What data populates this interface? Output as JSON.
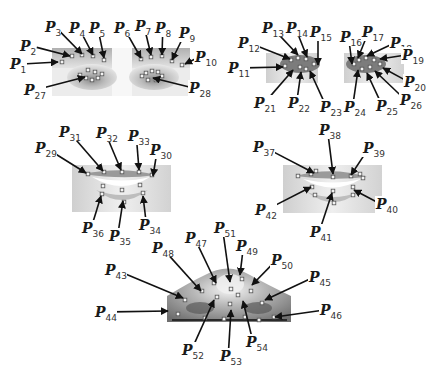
{
  "figure": {
    "point_color": "#f2f2f2",
    "arrow_color": "#111111"
  },
  "panels": [
    {
      "id": "eyes-left-image",
      "description": "Eyebrows and eyes",
      "image_box": [
        52,
        50,
        190,
        95
      ],
      "labels": [
        {
          "name": "P",
          "sub": "1",
          "lx": 18,
          "ly": 64,
          "tx": 58,
          "ty": 62
        },
        {
          "name": "P",
          "sub": "2",
          "lx": 28,
          "ly": 46,
          "tx": 70,
          "ty": 56
        },
        {
          "name": "P",
          "sub": "3",
          "lx": 53,
          "ly": 27,
          "tx": 82,
          "ty": 54
        },
        {
          "name": "P",
          "sub": "4",
          "lx": 77,
          "ly": 28,
          "tx": 93,
          "ty": 55
        },
        {
          "name": "P",
          "sub": "5",
          "lx": 97,
          "ly": 28,
          "tx": 104,
          "ty": 58
        },
        {
          "name": "P",
          "sub": "6",
          "lx": 122,
          "ly": 28,
          "tx": 141,
          "ty": 58
        },
        {
          "name": "P",
          "sub": "7",
          "lx": 143,
          "ly": 26,
          "tx": 151,
          "ty": 55
        },
        {
          "name": "P",
          "sub": "8",
          "lx": 163,
          "ly": 28,
          "tx": 162,
          "ty": 55
        },
        {
          "name": "P",
          "sub": "9",
          "lx": 187,
          "ly": 33,
          "tx": 172,
          "ty": 60
        },
        {
          "name": "P",
          "sub": "10",
          "lx": 203,
          "ly": 57,
          "tx": 185,
          "ty": 64
        },
        {
          "name": "P",
          "sub": "27",
          "lx": 32,
          "ly": 90,
          "tx": 85,
          "ty": 77
        },
        {
          "name": "P",
          "sub": "28",
          "lx": 197,
          "ly": 88,
          "tx": 153,
          "ty": 78
        }
      ],
      "points": [
        [
          62,
          62
        ],
        [
          72,
          56
        ],
        [
          82,
          55
        ],
        [
          93,
          56
        ],
        [
          104,
          60
        ],
        [
          141,
          59
        ],
        [
          151,
          57
        ],
        [
          162,
          56
        ],
        [
          172,
          61
        ],
        [
          182,
          65
        ],
        [
          88,
          70
        ],
        [
          80,
          75
        ],
        [
          86,
          78
        ],
        [
          92,
          80
        ],
        [
          98,
          78
        ],
        [
          102,
          74
        ],
        [
          95,
          72
        ],
        [
          146,
          73
        ],
        [
          152,
          71
        ],
        [
          158,
          72
        ],
        [
          162,
          76
        ],
        [
          156,
          80
        ],
        [
          148,
          80
        ],
        [
          142,
          76
        ]
      ]
    },
    {
      "id": "eyes-right-image",
      "description": "Eye contour close-up",
      "image_box": [
        266,
        53,
        404,
        83
      ],
      "labels": [
        {
          "name": "P",
          "sub": "11",
          "lx": 236,
          "ly": 68,
          "tx": 283,
          "ty": 67
        },
        {
          "name": "P",
          "sub": "12",
          "lx": 246,
          "ly": 43,
          "tx": 290,
          "ty": 59
        },
        {
          "name": "P",
          "sub": "13",
          "lx": 270,
          "ly": 28,
          "tx": 298,
          "ty": 55
        },
        {
          "name": "P",
          "sub": "14",
          "lx": 294,
          "ly": 28,
          "tx": 307,
          "ty": 57
        },
        {
          "name": "P",
          "sub": "15",
          "lx": 318,
          "ly": 32,
          "tx": 318,
          "ty": 65
        },
        {
          "name": "P",
          "sub": "16",
          "lx": 348,
          "ly": 37,
          "tx": 352,
          "ty": 64
        },
        {
          "name": "P",
          "sub": "17",
          "lx": 370,
          "ly": 32,
          "tx": 358,
          "ty": 58
        },
        {
          "name": "P",
          "sub": "18",
          "lx": 398,
          "ly": 43,
          "tx": 367,
          "ty": 56
        },
        {
          "name": "P",
          "sub": "19",
          "lx": 410,
          "ly": 55,
          "tx": 380,
          "ty": 59
        },
        {
          "name": "P",
          "sub": "20",
          "lx": 412,
          "ly": 82,
          "tx": 383,
          "ty": 68
        },
        {
          "name": "P",
          "sub": "21",
          "lx": 262,
          "ly": 103,
          "tx": 293,
          "ty": 70
        },
        {
          "name": "P",
          "sub": "22",
          "lx": 296,
          "ly": 103,
          "tx": 301,
          "ty": 72
        },
        {
          "name": "P",
          "sub": "23",
          "lx": 328,
          "ly": 107,
          "tx": 310,
          "ty": 71
        },
        {
          "name": "P",
          "sub": "24",
          "lx": 352,
          "ly": 107,
          "tx": 358,
          "ty": 70
        },
        {
          "name": "P",
          "sub": "25",
          "lx": 384,
          "ly": 106,
          "tx": 367,
          "ty": 73
        },
        {
          "name": "P",
          "sub": "26",
          "lx": 408,
          "ly": 100,
          "tx": 375,
          "ty": 71
        }
      ],
      "points": [
        [
          285,
          66
        ],
        [
          291,
          60
        ],
        [
          298,
          58
        ],
        [
          306,
          59
        ],
        [
          314,
          64
        ],
        [
          300,
          67
        ],
        [
          306,
          69
        ],
        [
          354,
          64
        ],
        [
          359,
          60
        ],
        [
          366,
          58
        ],
        [
          374,
          60
        ],
        [
          380,
          64
        ],
        [
          370,
          67
        ],
        [
          362,
          69
        ]
      ]
    },
    {
      "id": "mouth-left-image",
      "description": "Mouth outer contour",
      "image_box": [
        72,
        165,
        171,
        211
      ],
      "labels": [
        {
          "name": "P",
          "sub": "29",
          "lx": 43,
          "ly": 148,
          "tx": 86,
          "ty": 173
        },
        {
          "name": "P",
          "sub": "31",
          "lx": 67,
          "ly": 132,
          "tx": 103,
          "ty": 171
        },
        {
          "name": "P",
          "sub": "32",
          "lx": 104,
          "ly": 133,
          "tx": 121,
          "ty": 170
        },
        {
          "name": "P",
          "sub": "33",
          "lx": 136,
          "ly": 136,
          "tx": 139,
          "ty": 170
        },
        {
          "name": "P",
          "sub": "30",
          "lx": 158,
          "ly": 150,
          "tx": 153,
          "ty": 176
        },
        {
          "name": "P",
          "sub": "36",
          "lx": 90,
          "ly": 228,
          "tx": 101,
          "ty": 196
        },
        {
          "name": "P",
          "sub": "35",
          "lx": 117,
          "ly": 236,
          "tx": 123,
          "ty": 201
        },
        {
          "name": "P",
          "sub": "34",
          "lx": 147,
          "ly": 225,
          "tx": 143,
          "ty": 196
        }
      ],
      "points": [
        [
          88,
          174
        ],
        [
          104,
          172
        ],
        [
          122,
          172
        ],
        [
          139,
          172
        ],
        [
          152,
          175
        ],
        [
          103,
          186
        ],
        [
          122,
          190
        ],
        [
          140,
          185
        ],
        [
          102,
          194
        ],
        [
          124,
          202
        ],
        [
          143,
          193
        ]
      ]
    },
    {
      "id": "mouth-right-image",
      "description": "Mouth inner contour",
      "image_box": [
        283,
        165,
        382,
        213
      ],
      "labels": [
        {
          "name": "P",
          "sub": "37",
          "lx": 261,
          "ly": 147,
          "tx": 314,
          "ty": 173
        },
        {
          "name": "P",
          "sub": "38",
          "lx": 327,
          "ly": 130,
          "tx": 333,
          "ty": 174
        },
        {
          "name": "P",
          "sub": "39",
          "lx": 371,
          "ly": 148,
          "tx": 351,
          "ty": 175
        },
        {
          "name": "P",
          "sub": "40",
          "lx": 384,
          "ly": 204,
          "tx": 354,
          "ty": 190
        },
        {
          "name": "P",
          "sub": "41",
          "lx": 318,
          "ly": 232,
          "tx": 332,
          "ty": 193
        },
        {
          "name": "P",
          "sub": "42",
          "lx": 263,
          "ly": 210,
          "tx": 311,
          "ty": 187
        }
      ],
      "points": [
        [
          298,
          176
        ],
        [
          311,
          174
        ],
        [
          316,
          171
        ],
        [
          333,
          177
        ],
        [
          351,
          176
        ],
        [
          360,
          174
        ],
        [
          363,
          178
        ],
        [
          312,
          187
        ],
        [
          333,
          191
        ],
        [
          353,
          187
        ],
        [
          315,
          195
        ],
        [
          334,
          203
        ],
        [
          353,
          195
        ]
      ]
    },
    {
      "id": "nose-image",
      "description": "Nose region",
      "image_box": [
        167,
        268,
        291,
        322
      ],
      "labels": [
        {
          "name": "P",
          "sub": "43",
          "lx": 113,
          "ly": 270,
          "tx": 183,
          "ty": 298
        },
        {
          "name": "P",
          "sub": "44",
          "lx": 103,
          "ly": 312,
          "tx": 168,
          "ty": 311
        },
        {
          "name": "P",
          "sub": "48",
          "lx": 160,
          "ly": 248,
          "tx": 201,
          "ty": 291
        },
        {
          "name": "P",
          "sub": "47",
          "lx": 193,
          "ly": 238,
          "tx": 216,
          "ty": 283
        },
        {
          "name": "P",
          "sub": "51",
          "lx": 222,
          "ly": 228,
          "tx": 230,
          "ty": 282
        },
        {
          "name": "P",
          "sub": "49",
          "lx": 244,
          "ly": 246,
          "tx": 240,
          "ty": 275
        },
        {
          "name": "P",
          "sub": "50",
          "lx": 279,
          "ly": 260,
          "tx": 252,
          "ty": 285
        },
        {
          "name": "P",
          "sub": "45",
          "lx": 317,
          "ly": 277,
          "tx": 265,
          "ty": 300
        },
        {
          "name": "P",
          "sub": "46",
          "lx": 328,
          "ly": 310,
          "tx": 275,
          "ty": 317
        },
        {
          "name": "P",
          "sub": "52",
          "lx": 190,
          "ly": 350,
          "tx": 214,
          "ty": 300
        },
        {
          "name": "P",
          "sub": "53",
          "lx": 228,
          "ly": 356,
          "tx": 231,
          "ty": 310
        },
        {
          "name": "P",
          "sub": "54",
          "lx": 254,
          "ly": 342,
          "tx": 243,
          "ty": 301
        }
      ],
      "points": [
        [
          185,
          300
        ],
        [
          178,
          314
        ],
        [
          214,
          283
        ],
        [
          202,
          291
        ],
        [
          231,
          289
        ],
        [
          242,
          279
        ],
        [
          251,
          291
        ],
        [
          262,
          303
        ],
        [
          274,
          317
        ],
        [
          217,
          297
        ],
        [
          230,
          304
        ],
        [
          238,
          295
        ],
        [
          205,
          318
        ],
        [
          224,
          319
        ],
        [
          245,
          317
        ],
        [
          259,
          320
        ]
      ]
    }
  ]
}
